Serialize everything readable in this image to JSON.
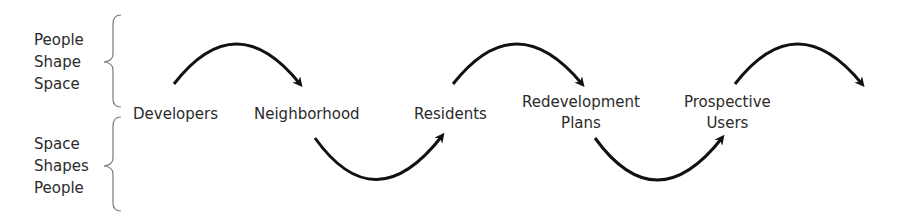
{
  "side_labels": {
    "top": {
      "lines": [
        "People",
        "Shape",
        "Space"
      ]
    },
    "bottom": {
      "lines": [
        "Space",
        "Shapes",
        "People"
      ]
    }
  },
  "nodes": [
    {
      "id": "developers",
      "lines": [
        "Developers"
      ]
    },
    {
      "id": "neighborhood",
      "lines": [
        "Neighborhood"
      ]
    },
    {
      "id": "residents",
      "lines": [
        "Residents"
      ]
    },
    {
      "id": "redevelopment-plans",
      "lines": [
        "Redevelopment",
        "Plans"
      ]
    },
    {
      "id": "prospective-users",
      "lines": [
        "Prospective",
        "Users"
      ]
    }
  ],
  "edges": [
    {
      "from": "developers",
      "to": "neighborhood",
      "style": "arc-over"
    },
    {
      "from": "neighborhood",
      "to": "residents",
      "style": "arc-under"
    },
    {
      "from": "residents",
      "to": "redevelopment-plans",
      "style": "arc-over"
    },
    {
      "from": "redevelopment-plans",
      "to": "prospective-users",
      "style": "arc-under"
    },
    {
      "from": "prospective-users",
      "to": "",
      "style": "arc-over"
    }
  ],
  "colors": {
    "arrow": "#111111",
    "text": "#2b2b2b",
    "brace": "#7a7a7a"
  }
}
